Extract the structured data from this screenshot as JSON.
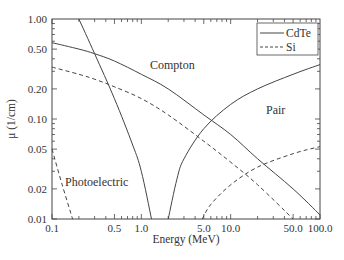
{
  "chart_data": {
    "type": "line",
    "title": "",
    "xlabel": "Energy (MeV)",
    "ylabel": "μ (1/cm)",
    "xscale": "log",
    "yscale": "log",
    "xlim": [
      0.1,
      100.0
    ],
    "ylim": [
      0.01,
      1.0
    ],
    "grid": false,
    "legend_position": "upper right",
    "x_ticks": [
      "0.1",
      "0.5",
      "1.0",
      "5.0",
      "10.0",
      "50.0",
      "100.0"
    ],
    "y_ticks": [
      "0.01",
      "0.02",
      "0.05",
      "0.10",
      "0.20",
      "0.50",
      "1.00"
    ],
    "legend": [
      {
        "name": "CdTe",
        "style": "solid"
      },
      {
        "name": "Si",
        "style": "dashed"
      }
    ],
    "annotations": [
      "Compton",
      "Pair",
      "Photoelectric"
    ],
    "series": [
      {
        "name": "CdTe",
        "component": "Photoelectric",
        "style": "solid",
        "x": [
          0.2,
          0.3,
          0.5,
          0.8,
          1.0,
          1.3
        ],
        "y": [
          1.0,
          0.45,
          0.16,
          0.055,
          0.03,
          0.01
        ]
      },
      {
        "name": "CdTe",
        "component": "Compton",
        "style": "solid",
        "x": [
          0.1,
          0.2,
          0.3,
          0.5,
          1.0,
          2.0,
          5.0,
          10.0,
          20.0,
          50.0,
          100.0
        ],
        "y": [
          0.58,
          0.5,
          0.45,
          0.38,
          0.28,
          0.2,
          0.11,
          0.07,
          0.04,
          0.02,
          0.011
        ]
      },
      {
        "name": "CdTe",
        "component": "Pair",
        "style": "solid",
        "x": [
          2.0,
          2.5,
          3.0,
          5.0,
          10.0,
          20.0,
          50.0,
          100.0
        ],
        "y": [
          0.01,
          0.025,
          0.04,
          0.08,
          0.14,
          0.2,
          0.28,
          0.35
        ]
      },
      {
        "name": "Si",
        "component": "Photoelectric",
        "style": "dashed",
        "x": [
          0.1,
          0.13,
          0.17
        ],
        "y": [
          0.05,
          0.022,
          0.01
        ]
      },
      {
        "name": "Si",
        "component": "Compton",
        "style": "dashed",
        "x": [
          0.1,
          0.2,
          0.3,
          0.5,
          1.0,
          2.0,
          5.0,
          10.0,
          20.0,
          50.0
        ],
        "y": [
          0.33,
          0.28,
          0.25,
          0.21,
          0.16,
          0.11,
          0.06,
          0.037,
          0.022,
          0.01
        ]
      },
      {
        "name": "Si",
        "component": "Pair",
        "style": "dashed",
        "x": [
          4.8,
          6.0,
          10.0,
          20.0,
          50.0,
          100.0
        ],
        "y": [
          0.01,
          0.014,
          0.022,
          0.033,
          0.045,
          0.053
        ]
      }
    ]
  }
}
